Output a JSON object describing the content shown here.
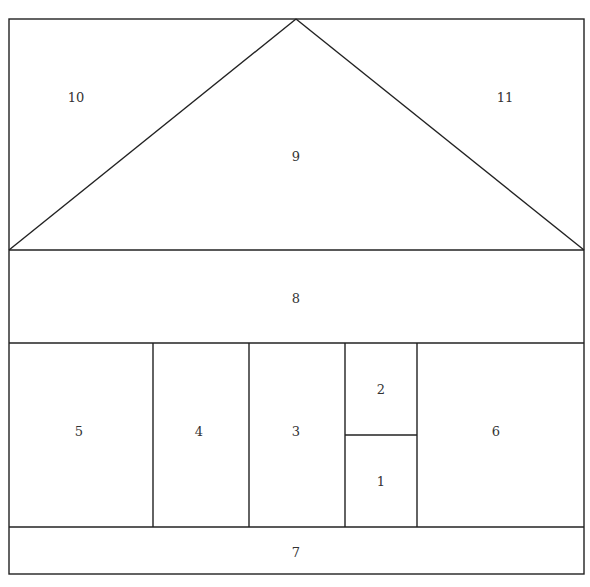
{
  "diagram": {
    "type": "floorplan-partition",
    "stroke_color": "#222222",
    "background": "#ffffff",
    "regions": [
      {
        "id": "1",
        "label": "1",
        "shape": "rect",
        "x": 345,
        "y": 435,
        "w": 72,
        "h": 92,
        "label_x": 381,
        "label_y": 481
      },
      {
        "id": "2",
        "label": "2",
        "shape": "rect",
        "x": 345,
        "y": 343,
        "w": 72,
        "h": 92,
        "label_x": 381,
        "label_y": 389
      },
      {
        "id": "3",
        "label": "3",
        "shape": "rect",
        "x": 249,
        "y": 343,
        "w": 96,
        "h": 184,
        "label_x": 296,
        "label_y": 431
      },
      {
        "id": "4",
        "label": "4",
        "shape": "rect",
        "x": 153,
        "y": 343,
        "w": 96,
        "h": 184,
        "label_x": 199,
        "label_y": 431
      },
      {
        "id": "5",
        "label": "5",
        "shape": "rect",
        "x": 9,
        "y": 343,
        "w": 144,
        "h": 184,
        "label_x": 79,
        "label_y": 431
      },
      {
        "id": "6",
        "label": "6",
        "shape": "rect",
        "x": 417,
        "y": 343,
        "w": 167,
        "h": 184,
        "label_x": 496,
        "label_y": 431
      },
      {
        "id": "7",
        "label": "7",
        "shape": "rect",
        "x": 9,
        "y": 527,
        "w": 575,
        "h": 47,
        "label_x": 296,
        "label_y": 552
      },
      {
        "id": "8",
        "label": "8",
        "shape": "rect",
        "x": 9,
        "y": 250,
        "w": 575,
        "h": 93,
        "label_x": 296,
        "label_y": 298
      },
      {
        "id": "9",
        "label": "9",
        "shape": "triangle",
        "points": "9,250 296,19 584,250",
        "label_x": 296,
        "label_y": 156
      },
      {
        "id": "10",
        "label": "10",
        "shape": "triangle",
        "points": "9,19 296,19 9,250",
        "label_x": 76,
        "label_y": 97
      },
      {
        "id": "11",
        "label": "11",
        "shape": "triangle",
        "points": "296,19 584,19 584,250",
        "label_x": 505,
        "label_y": 97
      }
    ]
  }
}
